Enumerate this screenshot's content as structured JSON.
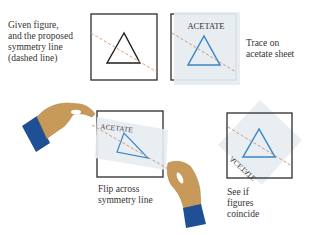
{
  "panels": [
    {
      "id": "given",
      "caption": [
        "Given figure,",
        "and the proposed",
        "symmetry line",
        "(dashed line)"
      ]
    },
    {
      "id": "trace",
      "caption": [
        "Trace on",
        "acetate sheet"
      ],
      "sheet_label": "ACETATE"
    },
    {
      "id": "flip",
      "caption": [
        "Flip across",
        "symmetry line"
      ],
      "sheet_label": "ACETATE"
    },
    {
      "id": "check",
      "caption": [
        "See if",
        "figures",
        "coincide"
      ],
      "sheet_label": "ACETATE"
    }
  ],
  "colors": {
    "frame": "#2b2b2b",
    "triangle_original": "#1e1e1e",
    "triangle_traced": "#3a86c8",
    "symmetry_line": "#e0a07a",
    "acetate": "#e6ecf1",
    "skin": "#c89a5a",
    "skin_shadow": "#a87a3e",
    "sleeve": "#1f4f95"
  }
}
